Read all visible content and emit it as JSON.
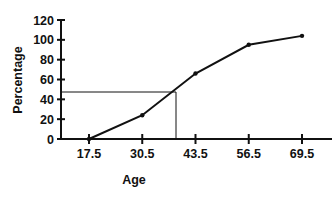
{
  "chart_data": {
    "type": "line",
    "title": "",
    "xlabel": "Age",
    "ylabel": "Percentage",
    "categories": [
      "17.5",
      "30.5",
      "43.5",
      "56.5",
      "69.5"
    ],
    "x": [
      17.5,
      30.5,
      43.5,
      56.5,
      69.5
    ],
    "values": [
      0,
      24,
      66,
      95,
      104
    ],
    "ylim": [
      0,
      120
    ],
    "yticks": [
      0,
      20,
      40,
      60,
      80,
      100,
      120
    ],
    "xticks": [
      17.5,
      30.5,
      43.5,
      56.5,
      69.5
    ],
    "grid": false,
    "legend": null,
    "annotations": [
      {
        "type": "reference-line",
        "description": "horizontal line from y-axis at ~48%",
        "y": 48
      },
      {
        "type": "reference-line",
        "description": "vertical line down to x-axis at age ~38.8",
        "x": 38.8
      }
    ]
  },
  "labels": {
    "xlabel": "Age",
    "ylabel": "Percentage",
    "yticks": [
      "0",
      "20",
      "40",
      "60",
      "80",
      "100",
      "120"
    ],
    "xticks": [
      "17.5",
      "30.5",
      "43.5",
      "56.5",
      "69.5"
    ]
  },
  "style": {
    "line_color": "#111111",
    "axis_color": "#111111"
  }
}
